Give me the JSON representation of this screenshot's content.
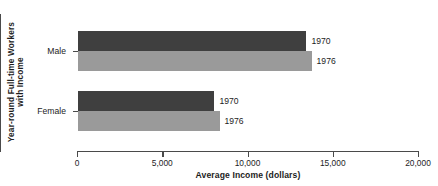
{
  "chart_data": {
    "type": "bar",
    "orientation": "horizontal",
    "title": "",
    "xlabel": "Average Income (dollars)",
    "ylabel": "Year-round Full-time Workers with Income",
    "ylabel_lines": [
      "Year-round Full-time Workers",
      "with Income"
    ],
    "categories": [
      "Male",
      "Female"
    ],
    "series": [
      {
        "name": "1970",
        "values": [
          13400,
          8000
        ],
        "color": "#3f3f3f"
      },
      {
        "name": "1976",
        "values": [
          13700,
          8300
        ],
        "color": "#9a9a9a"
      }
    ],
    "xlim": [
      0,
      20000
    ],
    "xticks": [
      0,
      5000,
      10000,
      15000,
      20000
    ],
    "xtick_labels": [
      "0",
      "5,000",
      "10,000",
      "15,000",
      "20,000"
    ],
    "grid": false,
    "legend": "inline-bar-end-labels",
    "bar_end_labels": [
      {
        "category": "Male",
        "series": "1970",
        "label": "1970"
      },
      {
        "category": "Male",
        "series": "1976",
        "label": "1976"
      },
      {
        "category": "Female",
        "series": "1970",
        "label": "1970"
      },
      {
        "category": "Female",
        "series": "1976",
        "label": "1976"
      }
    ]
  },
  "axes": {
    "x_title": "Average Income (dollars)",
    "y_title_line1": "Year-round Full-time Workers",
    "y_title_line2": "with Income",
    "x_tick_0": "0",
    "x_tick_1": "5,000",
    "x_tick_2": "10,000",
    "x_tick_3": "15,000",
    "x_tick_4": "20,000",
    "cat_male": "Male",
    "cat_female": "Female"
  },
  "bars": {
    "male_1970_label": "1970",
    "male_1976_label": "1976",
    "female_1970_label": "1970",
    "female_1976_label": "1976"
  },
  "colors": {
    "series_1970": "#3f3f3f",
    "series_1976": "#9a9a9a",
    "axis": "#4a4a4a",
    "background": "#ffffff"
  }
}
